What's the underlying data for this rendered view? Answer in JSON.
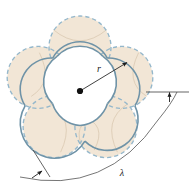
{
  "figure": {
    "background_color": "#ffffff",
    "labels": {
      "radius_label": "r",
      "wavelength_label": "λ"
    },
    "colors": {
      "petal_fill": "#f0e3d0",
      "solid_curve_stroke": "#6e93a8",
      "dashed_curve_stroke": "#8fb4c9",
      "inner_vein_stroke": "#c9b89f",
      "annotation_stroke": "#4a4a4a",
      "center_dot": "#111111",
      "arc_stroke": "#5a5a5a"
    },
    "geometry": {
      "petal_count": 5,
      "center_x": 80,
      "center_y": 91,
      "radius_r": 50,
      "radius_arrow_tip_x": 129,
      "radius_arrow_tip_y": 61,
      "lobe_circle_radius": 31,
      "lobe_center_distance": 44,
      "rotation_offset_deg": -90
    },
    "annotations": [
      {
        "name": "radius-arrow",
        "from": "center",
        "to": "petal-edge-upper-right",
        "label": "r"
      },
      {
        "name": "wavelength-arc",
        "label": "λ",
        "label_x": 122,
        "label_y": 173,
        "start_x": 20,
        "start_y": 176,
        "end_x": 178,
        "end_y": 92
      },
      {
        "name": "right-reference-line",
        "x1": 148,
        "y1": 92,
        "x2": 188,
        "y2": 92
      },
      {
        "name": "left-reference-line",
        "x1": 33,
        "y1": 153,
        "x2": 57,
        "y2": 185
      }
    ]
  }
}
